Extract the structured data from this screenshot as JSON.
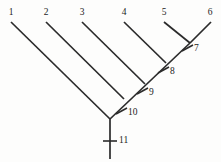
{
  "figure": {
    "type": "cladogram",
    "background_color": "#fdfdfc",
    "line_color": "#2b2b2b",
    "text_color": "#1c1c1c"
  },
  "taxa": [
    {
      "label": "1",
      "label_x": 4,
      "label_y": 8,
      "tip_x": 11,
      "tip_y": 22
    },
    {
      "label": "2",
      "label_x": 39,
      "label_y": 8,
      "tip_x": 46,
      "tip_y": 22
    },
    {
      "label": "3",
      "label_x": 75,
      "label_y": 8,
      "tip_x": 82,
      "tip_y": 22
    },
    {
      "label": "4",
      "label_x": 117,
      "label_y": 8,
      "tip_x": 124,
      "tip_y": 22
    },
    {
      "label": "5",
      "label_x": 157,
      "label_y": 8,
      "tip_x": 164,
      "tip_y": 22
    },
    {
      "label": "6",
      "label_x": 203,
      "label_y": 8,
      "tip_x": 211,
      "tip_y": 22
    }
  ],
  "nodes": [
    {
      "label": "7",
      "x": 190,
      "y": 42,
      "label_x": 194,
      "label_y": 44
    },
    {
      "label": "8",
      "x": 166,
      "y": 65,
      "label_x": 170,
      "label_y": 67
    },
    {
      "label": "9",
      "x": 145,
      "y": 86,
      "label_x": 149,
      "label_y": 88
    },
    {
      "label": "10",
      "x": 124,
      "y": 106,
      "label_x": 128,
      "label_y": 108
    },
    {
      "label": "11",
      "x": 110,
      "y": 141,
      "label_x": 119,
      "label_y": 136
    }
  ],
  "branches": [
    {
      "name": "branch-taxon-1",
      "x1": 11,
      "y1": 22,
      "x2": 110,
      "y2": 119
    },
    {
      "name": "branch-taxon-2",
      "x1": 46,
      "y1": 22,
      "x2": 124,
      "y2": 99
    },
    {
      "name": "branch-taxon-3",
      "x1": 82,
      "y1": 22,
      "x2": 145,
      "y2": 84
    },
    {
      "name": "branch-taxon-4",
      "x1": 124,
      "y1": 22,
      "x2": 166,
      "y2": 63
    },
    {
      "name": "branch-taxon-5",
      "x1": 164,
      "y1": 22,
      "x2": 190,
      "y2": 43
    },
    {
      "name": "branch-taxon-6",
      "x1": 211,
      "y1": 22,
      "x2": 190,
      "y2": 43
    },
    {
      "name": "branch-spine-7-to-root",
      "x1": 190,
      "y1": 43,
      "x2": 110,
      "y2": 119
    },
    {
      "name": "branch-root-stem",
      "x1": 110,
      "y1": 119,
      "x2": 110,
      "y2": 159
    }
  ],
  "ticks": [
    {
      "name": "tick-node-7",
      "x1": 182,
      "y1": 51,
      "x2": 193,
      "y2": 45
    },
    {
      "name": "tick-node-8",
      "x1": 158,
      "y1": 73,
      "x2": 169,
      "y2": 67
    },
    {
      "name": "tick-node-9",
      "x1": 137,
      "y1": 94,
      "x2": 148,
      "y2": 88
    },
    {
      "name": "tick-node-10",
      "x1": 116,
      "y1": 114,
      "x2": 127,
      "y2": 108
    },
    {
      "name": "tick-node-11",
      "x1": 103,
      "y1": 141,
      "x2": 117,
      "y2": 141
    }
  ]
}
